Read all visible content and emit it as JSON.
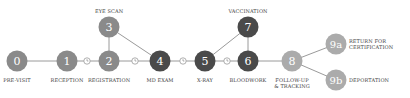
{
  "diagram": {
    "colors": {
      "medium": "#8a8a8a",
      "dark": "#4a4a4a",
      "light": "#ababab",
      "line": "#9a9a9a"
    },
    "nodes": [
      {
        "id": "0",
        "label": "PRE-VISIT",
        "x": 17,
        "y": 61,
        "tone": "medium"
      },
      {
        "id": "1",
        "label": "RECEPTION",
        "x": 67,
        "y": 61,
        "tone": "medium"
      },
      {
        "id": "2",
        "label": "REGISTRATION",
        "x": 109,
        "y": 61,
        "tone": "medium"
      },
      {
        "id": "3",
        "label": "EYE SCAN",
        "x": 109,
        "y": 27,
        "tone": "medium"
      },
      {
        "id": "4",
        "label": "MD EXAM",
        "x": 160,
        "y": 61,
        "tone": "dark"
      },
      {
        "id": "5",
        "label": "X-RAY",
        "x": 205,
        "y": 61,
        "tone": "dark"
      },
      {
        "id": "6",
        "label": "BLOODWORK",
        "x": 248,
        "y": 61,
        "tone": "dark"
      },
      {
        "id": "7",
        "label": "VACCINATION",
        "x": 248,
        "y": 27,
        "tone": "dark"
      },
      {
        "id": "8",
        "label_line1": "FOLLOW-UP",
        "label_line2": "& TRACKING",
        "x": 292,
        "y": 61,
        "tone": "light"
      },
      {
        "id": "9a",
        "label_line1": "RETURN FOR",
        "label_line2": "CERTIFICATION",
        "x": 336,
        "y": 44,
        "tone": "light"
      },
      {
        "id": "9b",
        "label": "DEPORTATION",
        "x": 336,
        "y": 80,
        "tone": "light"
      }
    ],
    "wait_icons": [
      "clock-icon",
      "clock-icon",
      "clock-icon",
      "clock-icon"
    ]
  }
}
